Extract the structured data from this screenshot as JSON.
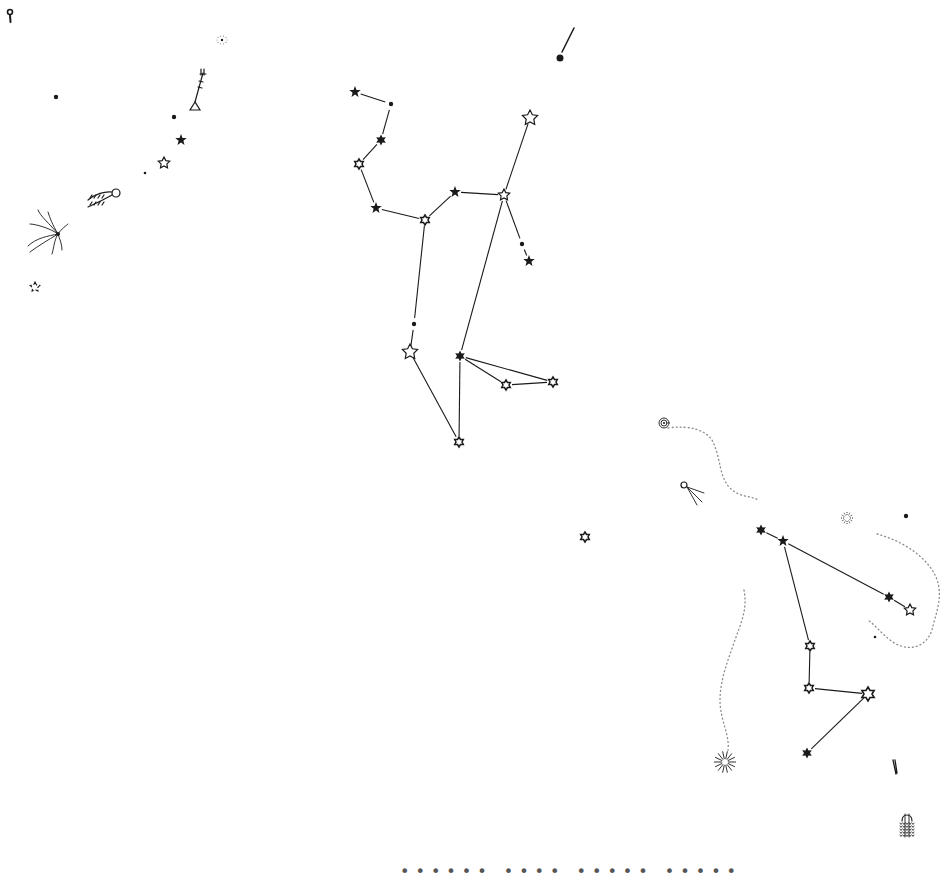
{
  "map": {
    "title": "Hand-drawn star chart",
    "ink_color": "#1a1a1a",
    "dotted_color": "#8a8a8a",
    "background": "#ffffff",
    "stars": [
      {
        "id": "s1",
        "x": 355,
        "y": 92,
        "symbol": "filled-star"
      },
      {
        "id": "s2",
        "x": 391,
        "y": 104,
        "symbol": "dot"
      },
      {
        "id": "s3",
        "x": 381,
        "y": 140,
        "symbol": "filled-hexagram"
      },
      {
        "id": "s4",
        "x": 359,
        "y": 164,
        "symbol": "hexagram"
      },
      {
        "id": "s5",
        "x": 376,
        "y": 208,
        "symbol": "filled-star"
      },
      {
        "id": "s6",
        "x": 425,
        "y": 220,
        "symbol": "hexagram"
      },
      {
        "id": "s7",
        "x": 455,
        "y": 192,
        "symbol": "filled-star"
      },
      {
        "id": "s8",
        "x": 504,
        "y": 195,
        "symbol": "open-star"
      },
      {
        "id": "s9",
        "x": 530,
        "y": 118,
        "symbol": "open-star-large"
      },
      {
        "id": "s10",
        "x": 522,
        "y": 244,
        "symbol": "dot"
      },
      {
        "id": "s11",
        "x": 529,
        "y": 261,
        "symbol": "filled-star"
      },
      {
        "id": "s12",
        "x": 414,
        "y": 324,
        "symbol": "dot"
      },
      {
        "id": "s13",
        "x": 410,
        "y": 352,
        "symbol": "open-star-large"
      },
      {
        "id": "s14",
        "x": 460,
        "y": 356,
        "symbol": "filled-hexagram"
      },
      {
        "id": "s15",
        "x": 506,
        "y": 385,
        "symbol": "hexagram"
      },
      {
        "id": "s16",
        "x": 553,
        "y": 382,
        "symbol": "hexagram"
      },
      {
        "id": "s17",
        "x": 459,
        "y": 442,
        "symbol": "hexagram"
      },
      {
        "id": "s18",
        "x": 560,
        "y": 58,
        "symbol": "big-dot"
      },
      {
        "id": "s19",
        "x": 585,
        "y": 537,
        "symbol": "hexagram"
      },
      {
        "id": "s20",
        "x": 761,
        "y": 530,
        "symbol": "filled-hexagram"
      },
      {
        "id": "s21",
        "x": 783,
        "y": 541,
        "symbol": "filled-star"
      },
      {
        "id": "s22",
        "x": 889,
        "y": 597,
        "symbol": "filled-hexagram"
      },
      {
        "id": "s23",
        "x": 910,
        "y": 610,
        "symbol": "open-star"
      },
      {
        "id": "s24",
        "x": 810,
        "y": 646,
        "symbol": "hexagram"
      },
      {
        "id": "s25",
        "x": 809,
        "y": 688,
        "symbol": "hexagram"
      },
      {
        "id": "s26",
        "x": 868,
        "y": 694,
        "symbol": "hexagram-large"
      },
      {
        "id": "s27",
        "x": 807,
        "y": 753,
        "symbol": "filled-hexagram"
      },
      {
        "id": "s28",
        "x": 181,
        "y": 140,
        "symbol": "filled-star"
      },
      {
        "id": "s29",
        "x": 164,
        "y": 163,
        "symbol": "open-star"
      },
      {
        "id": "s30",
        "x": 174,
        "y": 117,
        "symbol": "dot"
      },
      {
        "id": "s31",
        "x": 145,
        "y": 173,
        "symbol": "dot-small"
      },
      {
        "id": "s32",
        "x": 56,
        "y": 97,
        "symbol": "dot"
      },
      {
        "id": "s33",
        "x": 35,
        "y": 287,
        "symbol": "open-star-broken"
      },
      {
        "id": "s34",
        "x": 906,
        "y": 516,
        "symbol": "dot"
      },
      {
        "id": "s35",
        "x": 875,
        "y": 637,
        "symbol": "dot-small"
      }
    ],
    "lines": [
      [
        "s1",
        "s2"
      ],
      [
        "s2",
        "s3"
      ],
      [
        "s3",
        "s4"
      ],
      [
        "s4",
        "s5"
      ],
      [
        "s5",
        "s6"
      ],
      [
        "s6",
        "s7"
      ],
      [
        "s7",
        "s8"
      ],
      [
        "s8",
        "s9"
      ],
      [
        "s8",
        "s10"
      ],
      [
        "s10",
        "s11"
      ],
      [
        "s6",
        "s12"
      ],
      [
        "s12",
        "s13"
      ],
      [
        "s13",
        "s17"
      ],
      [
        "s8",
        "s14"
      ],
      [
        "s14",
        "s17"
      ],
      [
        "s14",
        "s15"
      ],
      [
        "s15",
        "s16"
      ],
      [
        "s14",
        "s16"
      ],
      [
        "s20",
        "s21"
      ],
      [
        "s21",
        "s22"
      ],
      [
        "s22",
        "s23"
      ],
      [
        "s21",
        "s24"
      ],
      [
        "s24",
        "s25"
      ],
      [
        "s25",
        "s26"
      ],
      [
        "s26",
        "s27"
      ]
    ],
    "symbols": [
      {
        "name": "key-symbol",
        "x": 10,
        "y": 15
      },
      {
        "name": "nebula-sparkle-symbol",
        "x": 222,
        "y": 40
      },
      {
        "name": "trident-lamp-symbol",
        "x": 195,
        "y": 85
      },
      {
        "name": "comet-ring-symbol",
        "x": 100,
        "y": 197
      },
      {
        "name": "comet-broom-symbol",
        "x": 50,
        "y": 232
      },
      {
        "name": "meteor-streak-symbol",
        "x": 567,
        "y": 42
      },
      {
        "name": "spiral-nebula-symbol",
        "x": 664,
        "y": 423
      },
      {
        "name": "comet-tail-symbol",
        "x": 690,
        "y": 490
      },
      {
        "name": "cluster-symbol",
        "x": 847,
        "y": 518
      },
      {
        "name": "burst-symbol",
        "x": 725,
        "y": 762
      },
      {
        "name": "small-comet-symbol",
        "x": 895,
        "y": 767
      },
      {
        "name": "beehive-symbol",
        "x": 907,
        "y": 827
      }
    ],
    "dotted_paths": [
      "M668,428 C690,425 705,430 712,440 C722,460 718,475 730,488 C740,498 750,495 758,500",
      "M877,534 C900,540 925,555 935,575 C945,595 935,615 932,630 C925,650 905,652 890,640 C880,632 875,625 868,620",
      "M744,590 C748,610 740,625 735,640 C728,660 720,680 720,700 C720,720 730,735 728,750"
    ],
    "caption": "•••••• •••• ••••• •••••"
  }
}
